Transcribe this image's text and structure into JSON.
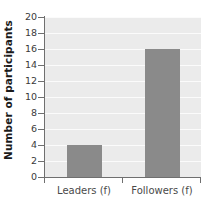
{
  "chart_data": {
    "type": "bar",
    "title": "",
    "xlabel": "",
    "ylabel": "Number of participants",
    "categories": [
      "Leaders (f)",
      "Followers (f)"
    ],
    "values": [
      4,
      16
    ],
    "series": [
      {
        "name": "Number of participants",
        "values": [
          4,
          16
        ]
      }
    ],
    "ylim": [
      0,
      20
    ],
    "yticks": [
      0,
      2,
      4,
      6,
      8,
      10,
      12,
      14,
      16,
      18,
      20
    ],
    "ytick_labels": [
      "0",
      "2",
      "4",
      "6",
      "8",
      "10",
      "12",
      "14",
      "16",
      "18",
      "20"
    ],
    "grid": true,
    "grid_axis": "y",
    "legend": false,
    "legend_position": "none",
    "bar_color": "#8a8a8a",
    "plot_background": "#ebebeb",
    "gridline_color": "#fbfbfb",
    "axis_color": "#6f6f6f",
    "label_color": "#4a4a4a",
    "title_color": "#1b1b1b"
  }
}
